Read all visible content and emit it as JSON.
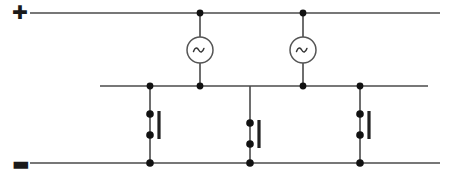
{
  "diagram": {
    "type": "electrical-circuit-schematic",
    "canvas": {
      "width": 460,
      "height": 180
    },
    "colors": {
      "background": "#ffffff",
      "wire": "#4a4a4a",
      "node": "#111111",
      "symbol_stroke": "#555555",
      "label": "#1a1a1a"
    }
  },
  "polarity": {
    "positive_label": "✚",
    "positive_name": "positive rail marker",
    "negative_label": "▬",
    "negative_name": "negative rail marker"
  },
  "buses": [
    {
      "id": "positive-bus",
      "label": "+",
      "y": 13,
      "x1": 30,
      "x2": 440,
      "width": 1.6
    },
    {
      "id": "mid-bus",
      "label": "",
      "y": 86,
      "x1": 100,
      "x2": 428,
      "width": 1.6
    },
    {
      "id": "negative-bus",
      "label": "-",
      "y": 163,
      "x1": 30,
      "x2": 440,
      "width": 1.6
    }
  ],
  "sources": [
    {
      "id": "ac-source-1",
      "glyph": "∼",
      "x": 200,
      "cy": 50,
      "r": 13,
      "top_y": 13,
      "bottom_y": 86
    },
    {
      "id": "ac-source-2",
      "glyph": "∼",
      "x": 303,
      "cy": 50,
      "r": 13,
      "top_y": 13,
      "bottom_y": 86
    }
  ],
  "switches": [
    {
      "id": "switch-1",
      "x": 150,
      "top_y": 86,
      "bottom_y": 163,
      "contact_top_y": 114,
      "contact_bottom_y": 135,
      "bar_x_offset": 9,
      "bar_y1": 111,
      "bar_y2": 139
    },
    {
      "id": "switch-2",
      "x": 250,
      "top_y": 86,
      "bottom_y": 163,
      "contact_top_y": 123,
      "contact_bottom_y": 144,
      "bar_x_offset": 9,
      "bar_y1": 120,
      "bar_y2": 148
    },
    {
      "id": "switch-3",
      "x": 360,
      "top_y": 86,
      "bottom_y": 163,
      "contact_top_y": 114,
      "contact_bottom_y": 135,
      "bar_x_offset": 9,
      "bar_y1": 111,
      "bar_y2": 139
    }
  ],
  "nodes": [
    {
      "id": "node-top-1",
      "x": 200,
      "y": 13,
      "r": 3.4
    },
    {
      "id": "node-top-2",
      "x": 303,
      "y": 13,
      "r": 3.4
    },
    {
      "id": "node-mid-1",
      "x": 150,
      "y": 86,
      "r": 3.4
    },
    {
      "id": "node-mid-2",
      "x": 200,
      "y": 86,
      "r": 3.4
    },
    {
      "id": "node-mid-3",
      "x": 303,
      "y": 86,
      "r": 3.4
    },
    {
      "id": "node-mid-4",
      "x": 360,
      "y": 86,
      "r": 3.4
    },
    {
      "id": "node-bot-1",
      "x": 150,
      "y": 163,
      "r": 3.8
    },
    {
      "id": "node-bot-2",
      "x": 250,
      "y": 163,
      "r": 3.8
    },
    {
      "id": "node-bot-3",
      "x": 360,
      "y": 163,
      "r": 3.8
    }
  ],
  "contact_dots": [
    {
      "id": "contact-1-top",
      "x": 150,
      "y": 114,
      "r": 3.8
    },
    {
      "id": "contact-1-bottom",
      "x": 150,
      "y": 135,
      "r": 3.8
    },
    {
      "id": "contact-2-top",
      "x": 250,
      "y": 123,
      "r": 3.8
    },
    {
      "id": "contact-2-bottom",
      "x": 250,
      "y": 144,
      "r": 3.8
    },
    {
      "id": "contact-3-top",
      "x": 360,
      "y": 114,
      "r": 3.8
    },
    {
      "id": "contact-3-bottom",
      "x": 360,
      "y": 135,
      "r": 3.8
    }
  ]
}
